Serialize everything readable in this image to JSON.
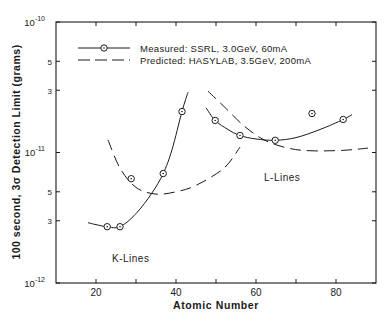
{
  "chart_data": {
    "type": "line",
    "title": "",
    "xlabel": "Atomic Number",
    "ylabel": "100 second, 3σ Detection Limit (grams)",
    "xlim": [
      10,
      90
    ],
    "ylim": [
      1e-12,
      1e-10
    ],
    "yscale": "log",
    "grid": false,
    "legend_position": "upper left",
    "x_ticks": [
      {
        "value": 20,
        "label": "20"
      },
      {
        "value": 40,
        "label": "40"
      },
      {
        "value": 60,
        "label": "60"
      },
      {
        "value": 80,
        "label": "80"
      }
    ],
    "y_ticks": [
      {
        "value": 1e-12,
        "label_base": "10",
        "label_exp": "-12"
      },
      {
        "value": 3e-12,
        "label_base": "3",
        "label_exp": ""
      },
      {
        "value": 5e-12,
        "label_base": "5",
        "label_exp": ""
      },
      {
        "value": 1e-11,
        "label_base": "10",
        "label_exp": "-11"
      },
      {
        "value": 3e-11,
        "label_base": "3",
        "label_exp": ""
      },
      {
        "value": 5e-11,
        "label_base": "5",
        "label_exp": ""
      },
      {
        "value": 1e-10,
        "label_base": "10",
        "label_exp": "-10"
      }
    ],
    "series": [
      {
        "name": "Measured: SSRL, 3.0GeV, 60mA",
        "style": "solid-with-circle-markers",
        "groups": [
          {
            "label": "K-Lines",
            "points": [
              [
                22.8,
                2.7e-12
              ],
              [
                26.0,
                2.7e-12
              ],
              [
                36.8,
                6.9e-12
              ],
              [
                41.5,
                2.06e-11
              ]
            ],
            "fit_curve": [
              [
                18.0,
                2.9e-12
              ],
              [
                20.0,
                2.8e-12
              ],
              [
                22.8,
                2.7e-12
              ],
              [
                26.0,
                2.7e-12
              ],
              [
                30.0,
                3.4e-12
              ],
              [
                34.0,
                4.9e-12
              ],
              [
                36.8,
                6.9e-12
              ],
              [
                39.0,
                1.05e-11
              ],
              [
                41.5,
                2.06e-11
              ],
              [
                43.0,
                2.9e-11
              ]
            ]
          },
          {
            "label": "L-Lines",
            "points": [
              [
                49.8,
                1.76e-11
              ],
              [
                56.0,
                1.35e-11
              ],
              [
                64.8,
                1.24e-11
              ],
              [
                81.8,
                1.79e-11
              ]
            ],
            "fit_curve": [
              [
                47.5,
                2.2e-11
              ],
              [
                49.8,
                1.76e-11
              ],
              [
                53.0,
                1.5e-11
              ],
              [
                56.0,
                1.35e-11
              ],
              [
                60.0,
                1.27e-11
              ],
              [
                64.8,
                1.24e-11
              ],
              [
                70.0,
                1.3e-11
              ],
              [
                76.0,
                1.5e-11
              ],
              [
                81.8,
                1.79e-11
              ],
              [
                84.0,
                1.95e-11
              ]
            ]
          }
        ],
        "outliers": [
          [
            28.8,
            6.3e-12
          ],
          [
            74.0,
            1.99e-11
          ]
        ]
      },
      {
        "name": "Predicted: HASYLAB, 3.5GeV, 200mA",
        "style": "dashed",
        "groups": [
          {
            "label": "K-Lines",
            "curve": [
              [
                23.0,
                1.25e-11
              ],
              [
                26.0,
                7.6e-12
              ],
              [
                30.0,
                5.4e-12
              ],
              [
                35.0,
                4.8e-12
              ],
              [
                40.0,
                5e-12
              ],
              [
                45.0,
                5.6e-12
              ],
              [
                52.0,
                7.6e-12
              ],
              [
                56.0,
                1.1e-11
              ]
            ]
          },
          {
            "label": "L-Lines",
            "curve": [
              [
                48.0,
                2.95e-11
              ],
              [
                52.0,
                2.25e-11
              ],
              [
                57.0,
                1.6e-11
              ],
              [
                62.0,
                1.25e-11
              ],
              [
                68.0,
                1.08e-11
              ],
              [
                74.0,
                1.03e-11
              ],
              [
                82.0,
                1.04e-11
              ],
              [
                88.0,
                1.08e-11
              ]
            ]
          }
        ]
      }
    ],
    "annotations": [
      {
        "text": "K-Lines",
        "x": 28,
        "y": 1.95e-12
      },
      {
        "text": "L-Lines",
        "x": 62,
        "y": 7.7e-12
      }
    ]
  },
  "legend": {
    "measured_label": "Measured: SSRL, 3.0GeV, 60mA",
    "predicted_label": "Predicted: HASYLAB, 3.5GeV, 200mA"
  },
  "labels": {
    "xlabel": "Atomic Number",
    "ylabel": "100 second, 3σ Detection Limit (grams)",
    "k_lines": "K-Lines",
    "l_lines": "L-Lines"
  },
  "colors": {
    "ink": "#1a1a1a",
    "background": "#ffffff"
  }
}
